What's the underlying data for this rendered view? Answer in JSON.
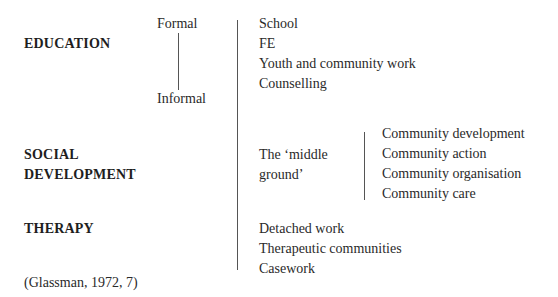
{
  "categories": {
    "education": "EDUCATION",
    "social_development": [
      "SOCIAL",
      "DEVELOPMENT"
    ],
    "therapy": "THERAPY"
  },
  "scale": {
    "top": "Formal",
    "bottom": "Informal"
  },
  "education_items": [
    "School",
    "FE",
    "Youth and community work",
    "Counselling"
  ],
  "middle_ground": [
    "The ‘middle",
    "ground’"
  ],
  "community_items": [
    "Community development",
    "Community action",
    "Community organisation",
    "Community care"
  ],
  "therapy_items": [
    "Detached work",
    "Therapeutic communities",
    "Casework"
  ],
  "citation": "(Glassman, 1972, 7)"
}
